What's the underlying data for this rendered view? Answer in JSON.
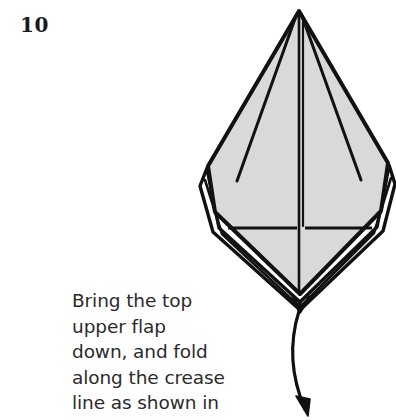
{
  "page": {
    "width": 396,
    "height": 420,
    "background_color": "#ffffff"
  },
  "step": {
    "number": "10",
    "number_color": "#1a1a1a"
  },
  "instruction": {
    "text": "Bring the top\nupper flap\ndown, and fold\nalong the crease\nline as shown in",
    "lines": [
      "Bring the top",
      "upper flap",
      "down, and fold",
      "along the crease",
      "line as shown in"
    ],
    "text_color": "#2b2b2b"
  },
  "diagram": {
    "name": "origami-folded-paper-kite-base",
    "paper_fill_color": "#d9d9d9",
    "paper_outline_color": "#111111",
    "crease_line_color": "#111111",
    "arrow_color": "#111111",
    "parts": [
      {
        "name": "upper-flap-panel",
        "label": "shaded upper flap"
      },
      {
        "name": "center-crease-line",
        "label": "vertical center crease"
      },
      {
        "name": "horizontal-crease-line",
        "label": "horizontal crease line"
      },
      {
        "name": "left-inner-crease",
        "label": "left inner crease"
      },
      {
        "name": "right-inner-crease",
        "label": "right inner crease"
      },
      {
        "name": "under-layer-left",
        "label": "left hidden layer"
      },
      {
        "name": "under-layer-right",
        "label": "right hidden layer"
      },
      {
        "name": "fold-arrow",
        "label": "curved fold direction arrow"
      }
    ]
  }
}
